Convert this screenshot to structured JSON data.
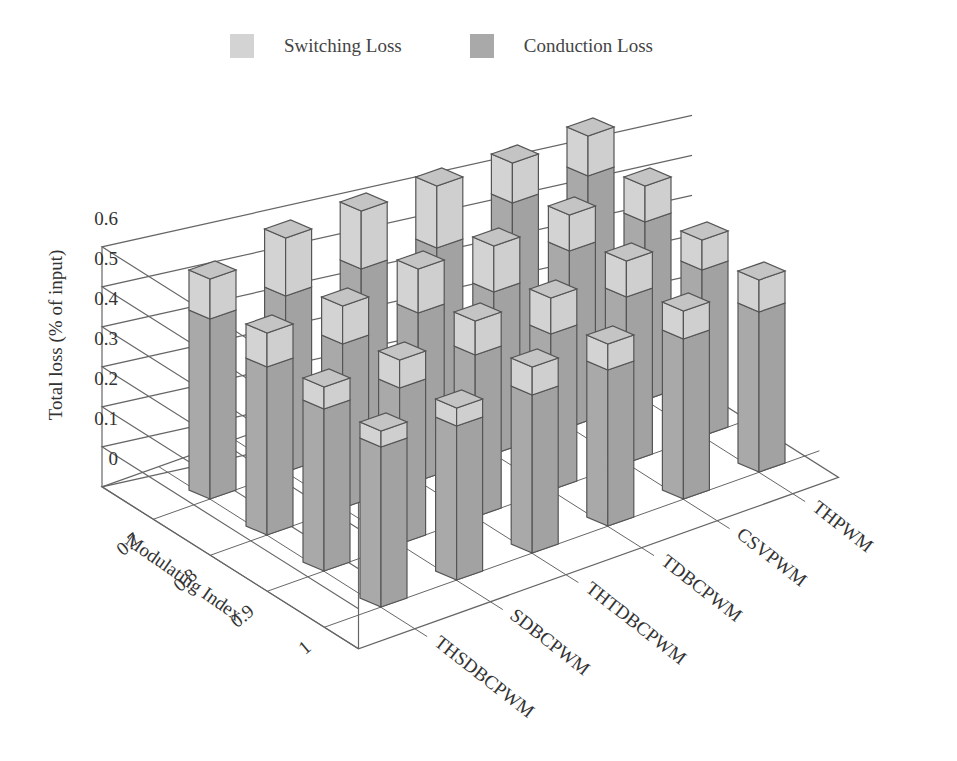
{
  "chart_data": {
    "type": "bar",
    "subtype": "3d-stacked-bar",
    "title": "",
    "ylabel": "Total loss (% of input)",
    "xlabel": "Modulating Index",
    "zlabel": "",
    "ylim": [
      0,
      0.6
    ],
    "yticks": [
      "0",
      "0.1",
      "0.2",
      "0.3",
      "0.4",
      "0.5",
      "0.6"
    ],
    "grid": true,
    "legend_position": "top",
    "modulating_index": [
      "0.7",
      "0.8",
      "0.9",
      "1"
    ],
    "techniques": [
      "THSDBCPWM",
      "SDBCPWM",
      "THTDBCPWM",
      "TDBCPWM",
      "CSVPWM",
      "THPWM"
    ],
    "series": [
      {
        "name": "Conduction Loss",
        "color": "#a9a9a9",
        "values": {
          "THSDBCPWM": [
            0.45,
            0.42,
            0.405,
            0.4
          ],
          "SDBCPWM": [
            0.44,
            0.41,
            0.39,
            0.385
          ],
          "THTDBCPWM": [
            0.44,
            0.42,
            0.405,
            0.395
          ],
          "TDBCPWM": [
            0.425,
            0.405,
            0.39,
            0.39
          ],
          "CSVPWM": [
            0.47,
            0.44,
            0.415,
            0.4
          ],
          "THPWM": [
            0.47,
            0.445,
            0.415,
            0.4
          ]
        }
      },
      {
        "name": "Switching Loss",
        "color": "#d3d3d3",
        "values": {
          "THSDBCPWM": [
            0.1,
            0.085,
            0.055,
            0.04
          ],
          "SDBCPWM": [
            0.145,
            0.095,
            0.07,
            0.045
          ],
          "THTDBCPWM": [
            0.145,
            0.11,
            0.085,
            0.07
          ],
          "TDBCPWM": [
            0.155,
            0.115,
            0.09,
            0.065
          ],
          "CSVPWM": [
            0.1,
            0.09,
            0.09,
            0.07
          ],
          "THPWM": [
            0.1,
            0.09,
            0.075,
            0.08
          ]
        }
      }
    ]
  },
  "legend": {
    "items": [
      {
        "label": "Switching Loss",
        "color": "#d3d3d3"
      },
      {
        "label": "Conduction Loss",
        "color": "#a9a9a9"
      }
    ]
  },
  "axes": {
    "y_label": "Total loss (% of input)",
    "x_label": "Modulating Index"
  }
}
